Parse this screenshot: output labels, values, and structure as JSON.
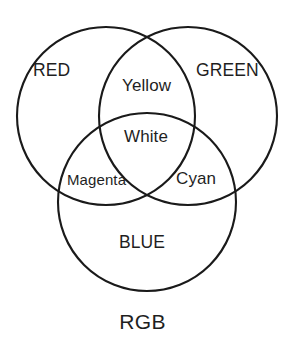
{
  "figure": {
    "caption": "RGB",
    "background_color": "#ffffff",
    "stroke_color": "#1a1a1a",
    "width": 285,
    "height": 348
  },
  "chart_data": {
    "type": "venn",
    "title": "RGB",
    "xlabel": "",
    "ylabel": "",
    "legend_position": "none",
    "grid": false,
    "sets": [
      {
        "name": "RED",
        "label": "RED",
        "cx": 106,
        "cy": 116,
        "r": 89,
        "color": "#ffffff",
        "stroke": "#1a1a1a"
      },
      {
        "name": "GREEN",
        "label": "GREEN",
        "cx": 188,
        "cy": 116,
        "r": 89,
        "color": "#ffffff",
        "stroke": "#1a1a1a"
      },
      {
        "name": "BLUE",
        "label": "BLUE",
        "cx": 147,
        "cy": 202,
        "r": 89,
        "color": "#ffffff",
        "stroke": "#1a1a1a"
      }
    ],
    "regions": [
      {
        "id": "red",
        "label": "RED",
        "members": [
          "RED"
        ],
        "x": 55,
        "y": 71
      },
      {
        "id": "green",
        "label": "GREEN",
        "members": [
          "GREEN"
        ],
        "x": 227,
        "y": 71
      },
      {
        "id": "blue",
        "label": "BLUE",
        "members": [
          "BLUE"
        ],
        "x": 146,
        "y": 243
      },
      {
        "id": "yellow",
        "label": "Yellow",
        "members": [
          "RED",
          "GREEN"
        ],
        "x": 150,
        "y": 86
      },
      {
        "id": "magenta",
        "label": "Magenta",
        "members": [
          "RED",
          "BLUE"
        ],
        "x": 99,
        "y": 180
      },
      {
        "id": "cyan",
        "label": "Cyan",
        "members": [
          "GREEN",
          "BLUE"
        ],
        "x": 198,
        "y": 179
      },
      {
        "id": "white",
        "label": "White",
        "members": [
          "RED",
          "GREEN",
          "BLUE"
        ],
        "x": 148,
        "y": 137
      }
    ],
    "labels": {
      "red": "RED",
      "green": "GREEN",
      "blue": "BLUE",
      "yellow": "Yellow",
      "magenta": "Magenta",
      "cyan": "Cyan",
      "white": "White",
      "caption": "RGB"
    }
  }
}
